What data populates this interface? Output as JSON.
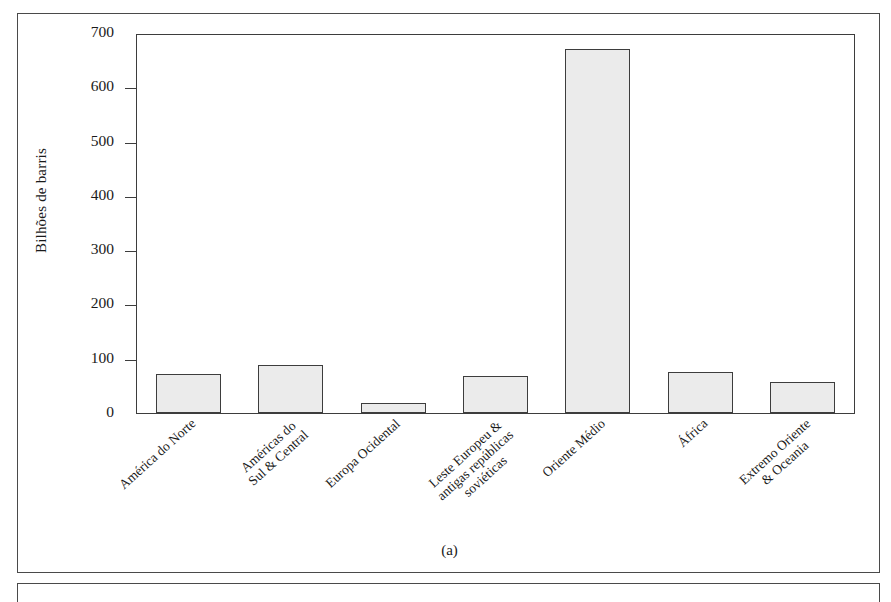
{
  "figure": {
    "caption": "(a)"
  },
  "chart_data": {
    "type": "bar",
    "title": "",
    "xlabel": "",
    "ylabel": "Bilhões de barris",
    "ylim": [
      0,
      700
    ],
    "yticks": [
      0,
      100,
      200,
      300,
      400,
      500,
      600,
      700
    ],
    "ytick_labels": [
      "0",
      "100",
      "200",
      "300",
      "400",
      "500",
      "600",
      "700"
    ],
    "grid": false,
    "legend": "none",
    "bar_fill_color": "#ebebeb",
    "bar_edge_color": "#3d3d3d",
    "categories": [
      "América do Norte",
      "Américas do Sul & Central",
      "Europa Ocidental",
      "Leste Europeu & antigas repúblicas soviéticas",
      "Oriente Médio",
      "África",
      "Extremo Oriente & Oceania"
    ],
    "category_lines": [
      [
        "América do Norte"
      ],
      [
        "Américas do",
        "Sul & Central"
      ],
      [
        "Europa Ocidental"
      ],
      [
        "Leste Europeu &",
        "antigas repúblicas",
        "soviéticas"
      ],
      [
        "Oriente Médio"
      ],
      [
        "África"
      ],
      [
        "Extremo Oriente",
        "& Oceania"
      ]
    ],
    "values": [
      72,
      89,
      18,
      68,
      675,
      76,
      58
    ]
  }
}
